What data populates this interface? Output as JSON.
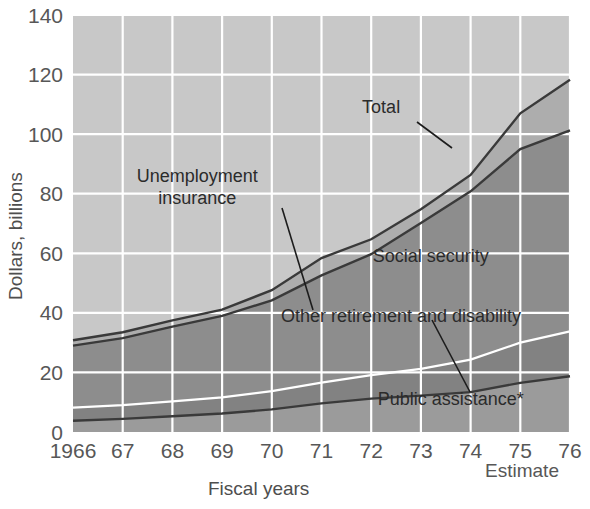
{
  "chart_data": {
    "type": "area",
    "stacked": true,
    "title": "",
    "xlabel": "Fiscal years",
    "ylabel": "Dollars, billions",
    "x": [
      1966,
      1967,
      1968,
      1969,
      1970,
      1971,
      1972,
      1973,
      1974,
      1975,
      1976
    ],
    "xtick_labels": [
      "1966",
      "67",
      "68",
      "69",
      "70",
      "71",
      "72",
      "73",
      "74",
      "75",
      "76"
    ],
    "ytick_labels": [
      "0",
      "20",
      "40",
      "60",
      "80",
      "100",
      "120",
      "140"
    ],
    "ytick_values": [
      0,
      20,
      40,
      60,
      80,
      100,
      120,
      140
    ],
    "ylim": [
      0,
      140
    ],
    "xlim": [
      1966,
      1976
    ],
    "grid": true,
    "legend_position": "inline-annotations",
    "annotations": [
      {
        "text": "Total",
        "x": 1972.2,
        "y": 107
      },
      {
        "text": "Unemployment insurance",
        "x": 1968.5,
        "y": 84
      },
      {
        "text": "Social security",
        "x": 1973.2,
        "y": 57
      },
      {
        "text": "Other retirement and disability",
        "x": 1972.6,
        "y": 37
      },
      {
        "text": "Public assistance*",
        "x": 1973.6,
        "y": 9
      }
    ],
    "estimate_note": "Estimate",
    "estimate_year": "75",
    "series": [
      {
        "name": "Public assistance*",
        "color": "#9b9b9b",
        "values": [
          3.8,
          4.4,
          5.3,
          6.2,
          7.6,
          9.6,
          11.2,
          12.2,
          13.4,
          16.5,
          18.7
        ]
      },
      {
        "name": "Other retirement and disability",
        "color": "#828282",
        "values": [
          4.4,
          4.6,
          5.0,
          5.4,
          6.1,
          7.0,
          7.9,
          9.0,
          10.9,
          13.5,
          15.1
        ]
      },
      {
        "name": "Social security",
        "color": "#8d8d8d",
        "values": [
          20.8,
          22.5,
          25.1,
          27.4,
          30.5,
          36.0,
          40.6,
          49.0,
          56.5,
          65.0,
          67.5
        ]
      },
      {
        "name": "Unemployment insurance",
        "color": "#adadad",
        "values": [
          1.8,
          2.0,
          2.1,
          2.1,
          3.4,
          5.8,
          5.0,
          4.6,
          5.5,
          12.0,
          17.0
        ]
      }
    ],
    "total": {
      "name": "Total",
      "values": [
        30.8,
        33.5,
        37.5,
        41.1,
        47.6,
        58.4,
        64.7,
        74.8,
        86.3,
        107.0,
        118.3
      ]
    },
    "colors": {
      "plot_background": "#c9c9c9",
      "upper_area": "#c2c2c2",
      "gridline": "#ffffff",
      "line": "#3a3a3a",
      "text": "#575757"
    }
  }
}
